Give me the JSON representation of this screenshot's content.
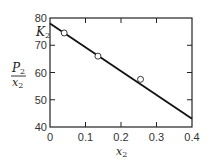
{
  "chart_data": {
    "type": "scatter",
    "title": "",
    "xlabel": "x2",
    "ylabel": "P2/x2",
    "annotation": "K2",
    "xlim": [
      0,
      0.4
    ],
    "ylim": [
      40,
      80
    ],
    "x_ticks": [
      "0",
      "0.1",
      "0.2",
      "0.3",
      "0.4"
    ],
    "y_ticks": [
      "40",
      "50",
      "60",
      "70",
      "80"
    ],
    "grid": false,
    "legend": null,
    "series": [
      {
        "name": "data points",
        "marker": "open-circle",
        "x": [
          0.04,
          0.135,
          0.255
        ],
        "y": [
          74.5,
          66.0,
          57.5
        ]
      },
      {
        "name": "fit line",
        "style": "solid-line",
        "x": [
          0,
          0.4
        ],
        "y": [
          78,
          43
        ]
      }
    ]
  },
  "labels": {
    "y_axis_num": "P",
    "y_axis_num_sub": "2",
    "y_axis_den": "x",
    "y_axis_den_sub": "2",
    "x_axis": "x",
    "x_axis_sub": "2",
    "k_label": "K",
    "k_label_sub": "2"
  },
  "ticks": {
    "x": [
      "0",
      "0.1",
      "0.2",
      "0.3",
      "0.4"
    ],
    "y": [
      "80",
      "70",
      "60",
      "50",
      "40"
    ]
  },
  "colors": {
    "line": "#111111",
    "axis": "#222222",
    "marker_fill": "#ffffff"
  }
}
